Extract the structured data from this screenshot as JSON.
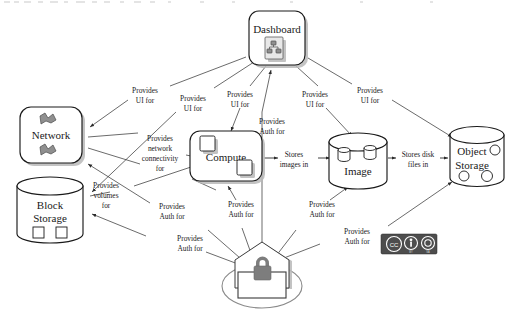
{
  "diagram": {
    "nodes": [
      {
        "id": "dashboard",
        "label": "Dashboard",
        "shape": "rounded-rect",
        "icon": "document-chart-icon",
        "x": 280,
        "y": 38
      },
      {
        "id": "network",
        "label": "Network",
        "shape": "rounded-rect",
        "icon": "network-icon",
        "x": 52,
        "y": 133
      },
      {
        "id": "block-storage",
        "label_line1": "Block",
        "label_line2": "Storage",
        "shape": "cylinder",
        "icon": "disk-squares-icon",
        "x": 50,
        "y": 208
      },
      {
        "id": "compute",
        "label": "Compute",
        "shape": "rounded-rect",
        "icon": "server-squares-icon",
        "x": 228,
        "y": 157
      },
      {
        "id": "image",
        "label": "Image",
        "shape": "cylinder",
        "icon": "image-disks-icon",
        "x": 358,
        "y": 162
      },
      {
        "id": "object-storage",
        "label_line1": "Object",
        "label_line2": "Storage",
        "shape": "cylinder",
        "icon": "object-circles-icon",
        "x": 477,
        "y": 155
      },
      {
        "id": "identity",
        "label": "",
        "shape": "house-lock",
        "icon": "padlock-icon",
        "x": 262,
        "y": 281
      }
    ],
    "edges": [
      {
        "id": "dashboard-network",
        "from": "dashboard",
        "to": "network",
        "label_line1": "Provides",
        "label_line2": "UI for",
        "lx": 145,
        "ly": 91
      },
      {
        "id": "dashboard-compute-ui",
        "from": "dashboard",
        "to": "compute",
        "label_line1": "Provides",
        "label_line2": "UI for",
        "lx": 240,
        "ly": 95
      },
      {
        "id": "dashboard-blockstorage",
        "from": "dashboard",
        "to": "block-storage",
        "label_line1": "Provides",
        "label_line2": "UI for",
        "lx": 193,
        "ly": 100
      },
      {
        "id": "dashboard-image",
        "from": "dashboard",
        "to": "image",
        "label_line1": "Provides",
        "label_line2": "UI for",
        "lx": 315,
        "ly": 96
      },
      {
        "id": "dashboard-objectstorage",
        "from": "dashboard",
        "to": "object-storage",
        "label_line1": "Provides",
        "label_line2": "UI for",
        "lx": 370,
        "ly": 91
      },
      {
        "id": "network-compute",
        "from": "network",
        "to": "compute",
        "label_line1": "Provides",
        "label_line2": "network",
        "label_line3": "connectivity",
        "label_line4": "for",
        "lx": 160,
        "ly": 139
      },
      {
        "id": "blockstorage-compute",
        "from": "block-storage",
        "to": "compute",
        "label_line1": "Provides",
        "label_line2": "volumes",
        "label_line3": "for",
        "lx": 105,
        "ly": 186
      },
      {
        "id": "compute-image",
        "from": "compute",
        "to": "image",
        "label_line1": "Stores",
        "label_line2": "images in",
        "lx": 293,
        "ly": 158
      },
      {
        "id": "image-objectstorage",
        "from": "image",
        "to": "object-storage",
        "label_line1": "Stores disk",
        "label_line2": "files in",
        "lx": 418,
        "ly": 158
      },
      {
        "id": "identity-dashboard",
        "from": "identity",
        "to": "dashboard",
        "label_line1": "Provides",
        "label_line2": "Auth for",
        "lx": 271,
        "ly": 123
      },
      {
        "id": "identity-network",
        "from": "identity",
        "to": "network",
        "label_line1": "Provides",
        "label_line2": "Auth for",
        "lx": 172,
        "ly": 207
      },
      {
        "id": "identity-blockstorage",
        "from": "identity",
        "to": "block-storage",
        "label_line1": "Provides",
        "label_line2": "Auth for",
        "lx": 172,
        "ly": 239
      },
      {
        "id": "identity-compute",
        "from": "identity",
        "to": "compute",
        "label_line1": "Provides",
        "label_line2": "Auth for",
        "lx": 240,
        "ly": 205
      },
      {
        "id": "identity-image",
        "from": "identity",
        "to": "image",
        "label_line1": "Provides",
        "label_line2": "Auth for",
        "lx": 322,
        "ly": 205
      },
      {
        "id": "identity-objectstorage",
        "from": "identity",
        "to": "object-storage",
        "label_line1": "Provides",
        "label_line2": "Auth for",
        "lx": 355,
        "ly": 232
      }
    ],
    "license_badge": {
      "name": "creative-commons-by-sa-badge",
      "cc_glyph": "CC",
      "by_glyph": "BY",
      "sa_glyph": "SA"
    }
  }
}
